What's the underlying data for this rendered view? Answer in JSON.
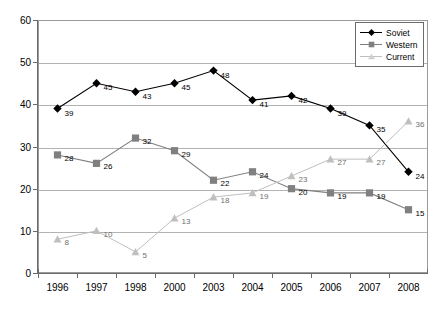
{
  "chart_data": {
    "type": "line",
    "title": "",
    "subtitle": "",
    "xlabel": "",
    "ylabel": "",
    "categories": [
      "1996",
      "1997",
      "1998",
      "2000",
      "2003",
      "2004",
      "2005",
      "2006",
      "2007",
      "2008"
    ],
    "ylim": [
      0,
      60
    ],
    "yticks": [
      0,
      10,
      20,
      30,
      40,
      50,
      60
    ],
    "grid": true,
    "grid_axis": "y",
    "legend_position": "top-right",
    "series": [
      {
        "name": "Soviet",
        "marker": "diamond",
        "color": "#000000",
        "values": [
          39,
          45,
          43,
          45,
          48,
          41,
          42,
          39,
          35,
          24
        ],
        "labels": [
          "39",
          "45",
          "43",
          "45",
          "48",
          "41",
          "42",
          "39",
          "35",
          "24"
        ]
      },
      {
        "name": "Western",
        "marker": "square",
        "color": "#808080",
        "values": [
          28,
          26,
          32,
          29,
          22,
          24,
          20,
          19,
          19,
          15
        ],
        "labels": [
          "28",
          "26",
          "32",
          "29",
          "22",
          "24",
          "20",
          "19",
          "19",
          "15"
        ]
      },
      {
        "name": "Current",
        "marker": "triangle",
        "color": "#bfbfbf",
        "values": [
          8,
          10,
          5,
          13,
          18,
          19,
          23,
          27,
          27,
          36
        ],
        "labels": [
          "8",
          "10",
          "5",
          "13",
          "18",
          "19",
          "23",
          "27",
          "27",
          "36"
        ]
      }
    ]
  },
  "legend": {
    "items": [
      {
        "label": "Soviet"
      },
      {
        "label": "Western"
      },
      {
        "label": "Current"
      }
    ]
  },
  "colors": {
    "soviet": "#000000",
    "western": "#808080",
    "current": "#bfbfbf",
    "grid": "#b3b3b3",
    "axis": "#6b6b6b",
    "plot_border": "#9a9a9a",
    "background": "#ffffff"
  }
}
